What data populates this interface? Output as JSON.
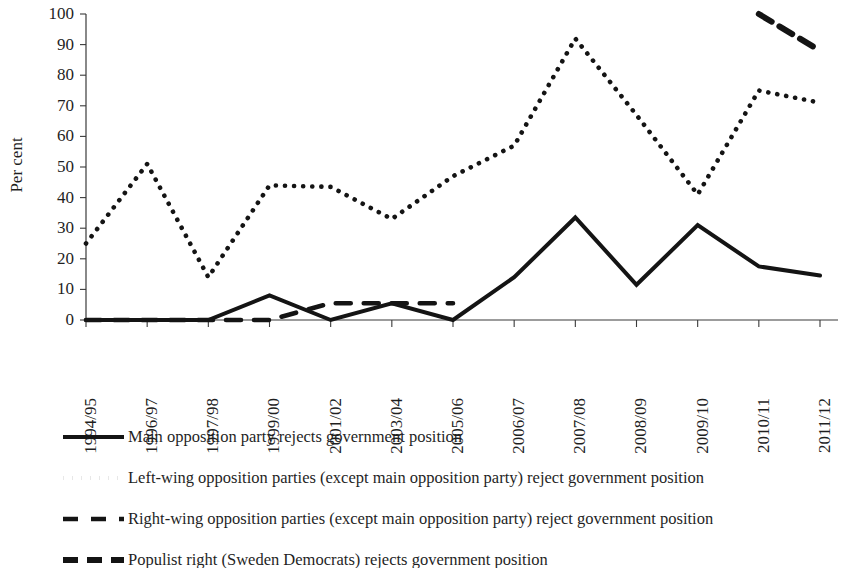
{
  "chart_data": {
    "type": "line",
    "title": "",
    "xlabel": "",
    "ylabel": "Per cent",
    "ylim": [
      0,
      100
    ],
    "ytick_step": 10,
    "yticks": [
      0,
      10,
      20,
      30,
      40,
      50,
      60,
      70,
      80,
      90,
      100
    ],
    "grid": false,
    "legend_position": "below",
    "categories": [
      "1994/95",
      "1996/97",
      "1997/98",
      "1999/00",
      "2001/02",
      "2003/04",
      "2005/06",
      "2006/07",
      "2007/08",
      "2008/09",
      "2009/10",
      "2010/11",
      "2011/12"
    ],
    "series": [
      {
        "name": "Main opposition party rejects government position",
        "style": "solid",
        "color": "#141414",
        "values": [
          0,
          0,
          0,
          8,
          0,
          5.5,
          0,
          14,
          33.5,
          11.5,
          31,
          17.5,
          14.5
        ]
      },
      {
        "name": "Left-wing opposition parties (except main opposition party) reject government position",
        "style": "dotted",
        "color": "#141414",
        "values": [
          25,
          51,
          14,
          44,
          43.5,
          33,
          47,
          57,
          92,
          67,
          41,
          75,
          71
        ]
      },
      {
        "name": "Right-wing opposition parties (except main opposition party) reject government position",
        "style": "dashed-long",
        "color": "#141414",
        "values": [
          0,
          0,
          0,
          0,
          5.5,
          5.5,
          5.5,
          null,
          null,
          null,
          null,
          null,
          null
        ]
      },
      {
        "name": "Populist right (Sweden Democrats) rejects government position",
        "style": "dashed-short",
        "color": "#141414",
        "values": [
          null,
          null,
          null,
          null,
          null,
          null,
          null,
          null,
          null,
          null,
          null,
          100,
          88
        ]
      }
    ]
  },
  "legend": {
    "items": [
      {
        "label": "Main opposition party rejects government position",
        "style": "solid"
      },
      {
        "label": "Left-wing opposition parties (except main opposition party) reject government position",
        "style": "dotted"
      },
      {
        "label": "Right-wing opposition  parties (except main opposition party) reject government position",
        "style": "dashed-long"
      },
      {
        "label": "Populist right (Sweden Democrats) rejects government position",
        "style": "dashed-short"
      }
    ]
  }
}
